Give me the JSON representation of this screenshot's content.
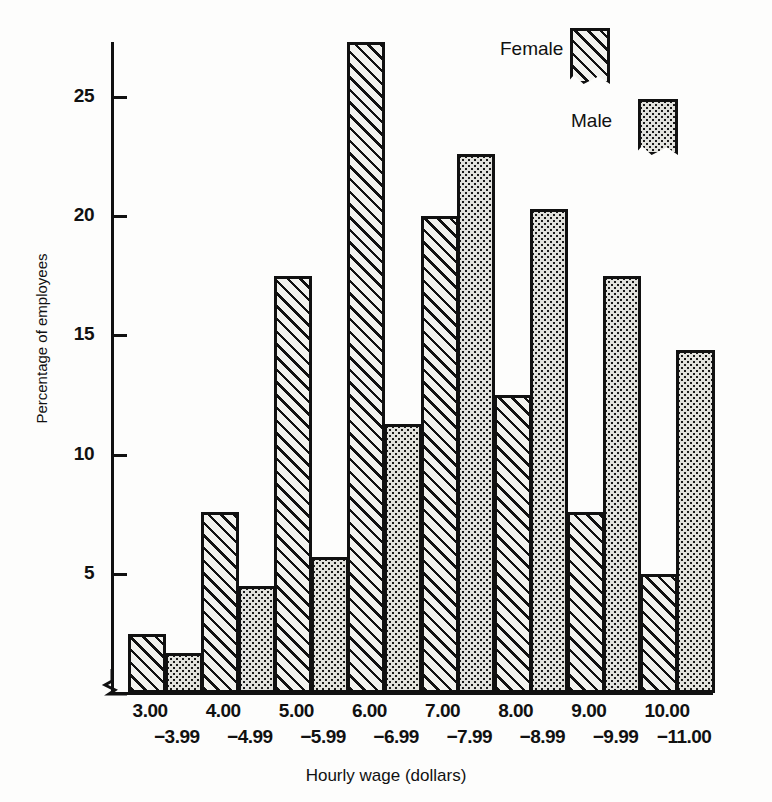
{
  "chart_data": {
    "type": "bar",
    "title": "",
    "xlabel": "Hourly wage  (dollars)",
    "ylabel": "Percentage of employees",
    "categories": [
      "3.00 -3.99",
      "4.00 -4.99",
      "5.00 -5.99",
      "6.00 -6.99",
      "7.00 -7.99",
      "8.00 -8.99",
      "9.00 -9.99",
      "10.00 -11.00"
    ],
    "category_lower": [
      "3.00",
      "4.00",
      "5.00",
      "6.00",
      "7.00",
      "8.00",
      "9.00",
      "10.00"
    ],
    "category_upper": [
      "−3.99",
      "−4.99",
      "−5.99",
      "−6.99",
      "−7.99",
      "−8.99",
      "−9.99",
      "−11.00"
    ],
    "series": [
      {
        "name": "Female",
        "values": [
          2.4,
          7.5,
          17.4,
          27.2,
          19.9,
          12.4,
          7.5,
          4.9
        ]
      },
      {
        "name": "Male",
        "values": [
          1.6,
          4.4,
          5.6,
          11.2,
          22.5,
          20.2,
          17.4,
          14.3
        ]
      }
    ],
    "ylim": [
      0,
      27.8
    ],
    "yticks": [
      5,
      10,
      15,
      20,
      25
    ],
    "ytick_labels": [
      "5",
      "10",
      "15",
      "20",
      "25"
    ],
    "grid": false,
    "axis_break": true,
    "legend": {
      "position": "top-right",
      "entries": [
        {
          "label": "Female",
          "pattern": "diagonal-hatch"
        },
        {
          "label": "Male",
          "pattern": "stipple-dots"
        }
      ]
    }
  },
  "colors": {
    "ink": "#111111",
    "female_fill": "#f2f2ee",
    "male_fill": "#e2e2dd",
    "background": "#fdfdfc"
  }
}
